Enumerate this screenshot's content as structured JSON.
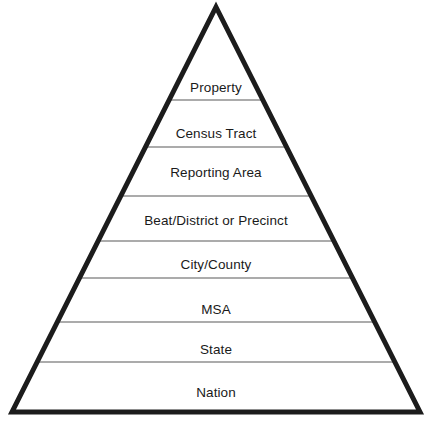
{
  "figure": {
    "name": "geographic-hierarchy-pyramid",
    "shape": "triangle",
    "background_color": "#ffffff",
    "outline_color": "#1c1c1c",
    "outline_width_px": 5,
    "divider_color": "#8f8f8f",
    "divider_width_px": 1.4,
    "text_color": "#1a1a1a",
    "apex": {
      "x": 216,
      "y": 7
    },
    "base_left": {
      "x": 12,
      "y": 412
    },
    "base_right": {
      "x": 420,
      "y": 412
    }
  },
  "tiers": [
    {
      "label": "Property",
      "label_y": 88,
      "divider_y": 100
    },
    {
      "label": "Census Tract",
      "label_y": 134,
      "divider_y": 147
    },
    {
      "label": "Reporting Area",
      "label_y": 173,
      "divider_y": 196
    },
    {
      "label": "Beat/District or Precinct",
      "label_y": 221,
      "divider_y": 241
    },
    {
      "label": "City/County",
      "label_y": 265,
      "divider_y": 278
    },
    {
      "label": "MSA",
      "label_y": 310,
      "divider_y": 322
    },
    {
      "label": "State",
      "label_y": 350,
      "divider_y": 362
    },
    {
      "label": "Nation",
      "label_y": 393,
      "divider_y": null
    }
  ]
}
